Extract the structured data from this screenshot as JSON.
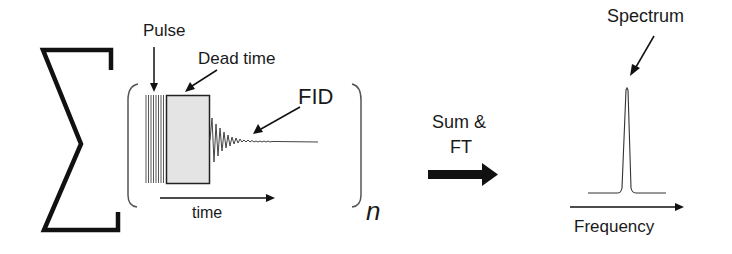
{
  "labels": {
    "pulse": "Pulse",
    "dead_time": "Dead time",
    "fid": "FID",
    "time": "time",
    "n": "n",
    "sum_ft_line1": "Sum &",
    "sum_ft_line2": "FT",
    "spectrum": "Spectrum",
    "frequency": "Frequency"
  },
  "colors": {
    "ink": "#1a1a1a",
    "dead_time_fill": "#e4e4e4"
  }
}
